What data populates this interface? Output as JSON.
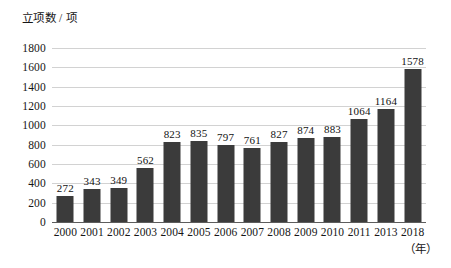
{
  "chart_data": {
    "type": "bar",
    "title": "",
    "subtitle": "",
    "xlabel": "（年）",
    "ylabel": "立项数 / 项",
    "categories": [
      "2000",
      "2001",
      "2002",
      "2003",
      "2004",
      "2005",
      "2006",
      "2007",
      "2008",
      "2009",
      "2010",
      "2011",
      "2013",
      "2018"
    ],
    "values": [
      272,
      343,
      349,
      562,
      823,
      835,
      797,
      761,
      827,
      874,
      883,
      1064,
      1164,
      1578
    ],
    "value_labels": [
      "272",
      "343",
      "349",
      "562",
      "823",
      "835",
      "797",
      "761",
      "827",
      "874",
      "883",
      "1064",
      "1164",
      "1578"
    ],
    "ylim": [
      0,
      1800
    ],
    "ytick_values": [
      0,
      200,
      400,
      600,
      800,
      1000,
      1200,
      1400,
      1600,
      1800
    ],
    "ytick_labels": [
      "0",
      "200",
      "400",
      "600",
      "800",
      "1000",
      "1200",
      "1400",
      "1600",
      "1800"
    ],
    "grid": true,
    "legend": false,
    "legend_position": "none",
    "bar_color": "#3b3b3b",
    "grid_color": "#d2d2d2",
    "axis_color": "#5d5d5d",
    "background_color": "#ffffff"
  }
}
